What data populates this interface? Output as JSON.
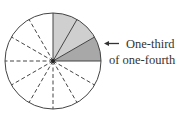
{
  "diagram": {
    "type": "fraction-circle",
    "total_parts": 12,
    "label": {
      "line1": "One-third",
      "line2": "of one-fourth"
    },
    "colors": {
      "light_shade": "#cfcfcf",
      "dark_shade": "#a8a8a8",
      "stroke": "#444444"
    }
  }
}
